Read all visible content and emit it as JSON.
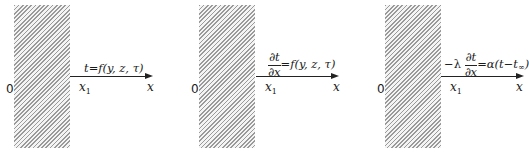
{
  "diagram": {
    "panels": [
      {
        "id": "first-kind",
        "origin_label": "0",
        "surface_label": "x",
        "surface_sub": "1",
        "axis_label": "x",
        "formula": {
          "lhs": "t",
          "eq": "=",
          "rhs": "f(y, z, τ)"
        }
      },
      {
        "id": "second-kind",
        "origin_label": "0",
        "surface_label": "x",
        "surface_sub": "1",
        "axis_label": "x",
        "formula": {
          "num": "∂t",
          "den": "∂x",
          "eq": "=",
          "rhs": "f(y, z, τ)"
        }
      },
      {
        "id": "third-kind",
        "origin_label": "0",
        "surface_label": "x",
        "surface_sub": "1",
        "axis_label": "x",
        "formula": {
          "prefix": "−λ",
          "num": "∂t",
          "den": "∂x",
          "eq": "=",
          "rhs_main": "α(t−t",
          "rhs_sub": "∞",
          "rhs_close": ")"
        }
      }
    ]
  }
}
